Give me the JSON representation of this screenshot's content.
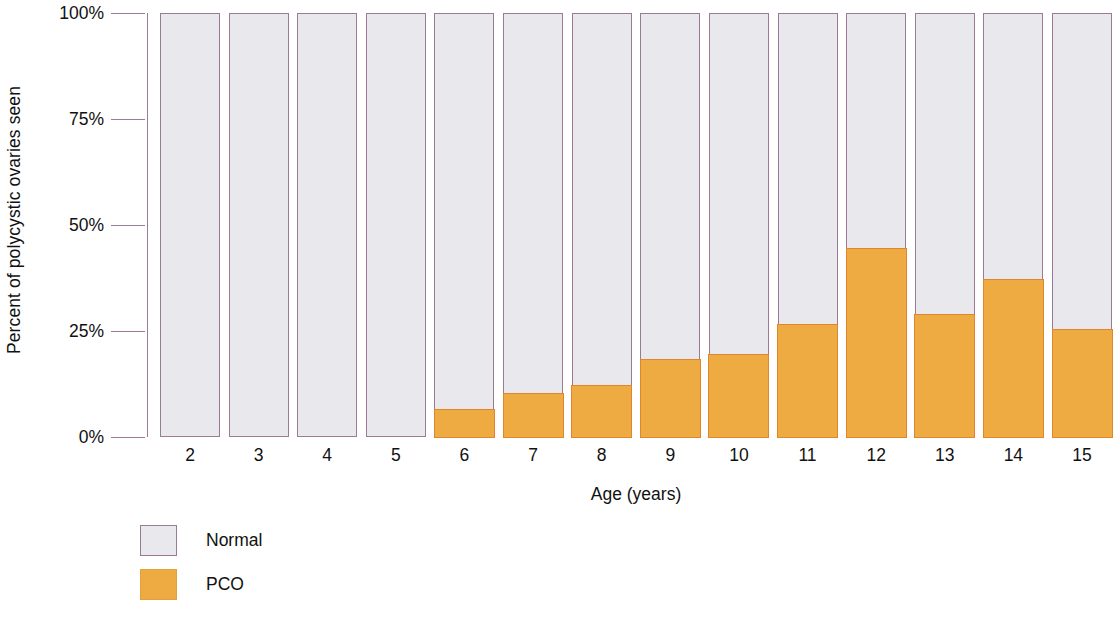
{
  "chart_data": {
    "type": "bar",
    "title": "",
    "subtitle": "",
    "xlabel": "Age (years)",
    "ylabel": "Percent of polycystic ovaries seen",
    "stacked": true,
    "stack_total": 100,
    "grid": false,
    "legend_position": "bottom-left",
    "ylim": [
      0,
      100
    ],
    "ytick_labels": [
      "0%",
      "25%",
      "50%",
      "75%",
      "100%"
    ],
    "ytick_values": [
      0,
      25,
      50,
      75,
      100
    ],
    "categories": [
      "2",
      "3",
      "4",
      "5",
      "6",
      "7",
      "8",
      "9",
      "10",
      "11",
      "12",
      "13",
      "14",
      "15"
    ],
    "series": [
      {
        "name": "PCO",
        "color": "#eeab42",
        "values": [
          0,
          0,
          0,
          0,
          6.8,
          10.4,
          12.5,
          18.6,
          19.8,
          26.7,
          44.6,
          29.2,
          37.3,
          25.7
        ]
      },
      {
        "name": "Normal",
        "color": "#e9e8ed",
        "values": [
          100,
          100,
          100,
          100,
          93.2,
          89.6,
          87.5,
          81.4,
          80.2,
          73.3,
          55.4,
          70.8,
          62.7,
          74.3
        ]
      }
    ],
    "annotations": []
  },
  "legend": {
    "items": [
      {
        "label": "Normal",
        "swatch": "normal-swatch"
      },
      {
        "label": "PCO",
        "swatch": "pco-swatch"
      }
    ]
  },
  "colors": {
    "pco_fill": "#eeab42",
    "pco_border": "#e2852f",
    "normal_fill": "#e9e8ed",
    "normal_border": "#9c7a96",
    "axis": "#9c7a96",
    "text": "#111111",
    "background": "#ffffff"
  }
}
